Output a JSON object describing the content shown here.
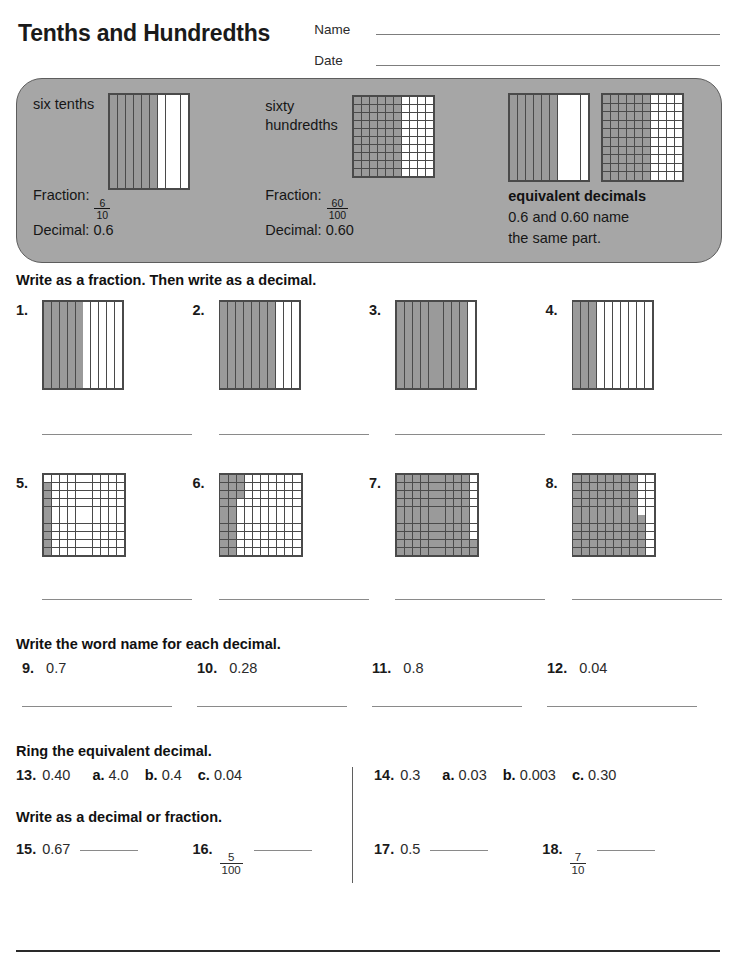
{
  "header": {
    "title": "Tenths and Hundredths",
    "name_label": "Name",
    "date_label": "Date"
  },
  "example": {
    "item1": {
      "word": "six tenths",
      "fraction_label": "Fraction:",
      "numerator": "6",
      "denominator": "10",
      "decimal_label": "Decimal:",
      "decimal_value": "0.6",
      "model": {
        "type": "tenths",
        "shaded": 6,
        "total": 10
      }
    },
    "item2": {
      "word_line1": "sixty",
      "word_line2": "hundredths",
      "fraction_label": "Fraction:",
      "numerator": "60",
      "denominator": "100",
      "decimal_label": "Decimal:",
      "decimal_value": "0.60",
      "model": {
        "type": "hundredths",
        "shaded_columns": 6,
        "total": 100
      }
    },
    "item3": {
      "title": "equivalent decimals",
      "text_line1": "0.6 and 0.60 name",
      "text_line2": "the same part.",
      "model_a": {
        "type": "tenths",
        "shaded": 6,
        "total": 10
      },
      "model_b": {
        "type": "hundredths",
        "shaded_columns": 6,
        "total": 100
      }
    }
  },
  "section1": {
    "instruction": "Write as a fraction. Then write as a decimal.",
    "problems": [
      {
        "num": "1.",
        "type": "tenths",
        "shaded": 5,
        "total": 10
      },
      {
        "num": "2.",
        "type": "tenths",
        "shaded": 7,
        "total": 10
      },
      {
        "num": "3.",
        "type": "tenths",
        "shaded": 9,
        "total": 10
      },
      {
        "num": "4.",
        "type": "tenths",
        "shaded": 3,
        "total": 10
      }
    ]
  },
  "section2": {
    "problems": [
      {
        "num": "5.",
        "type": "hundredths",
        "shaded": 9,
        "total": 100,
        "pattern": "col1-rows2to10"
      },
      {
        "num": "6.",
        "type": "hundredths",
        "shaded": 26,
        "total": 100,
        "pattern": "cols1to3-rows1to3-plus-cols1to2-rows4to10"
      },
      {
        "num": "7.",
        "type": "hundredths",
        "shaded": 92,
        "total": 100,
        "pattern": "cols1to9-plus-col10-rows9to10"
      },
      {
        "num": "8.",
        "type": "hundredths",
        "shaded": 85,
        "total": 100,
        "pattern": "cols1to8-rows1to5-plus-cols1to9-rows6to10"
      }
    ]
  },
  "section3": {
    "instruction": "Write the word name for each decimal.",
    "problems": [
      {
        "num": "9.",
        "value": "0.7"
      },
      {
        "num": "10.",
        "value": "0.28"
      },
      {
        "num": "11.",
        "value": "0.8"
      },
      {
        "num": "12.",
        "value": "0.04"
      }
    ]
  },
  "section4": {
    "instruction": "Ring the equivalent decimal.",
    "problems": [
      {
        "num": "13.",
        "value": "0.40",
        "choices": [
          {
            "letter": "a.",
            "value": "4.0"
          },
          {
            "letter": "b.",
            "value": "0.4"
          },
          {
            "letter": "c.",
            "value": "0.04"
          }
        ]
      },
      {
        "num": "14.",
        "value": "0.3",
        "choices": [
          {
            "letter": "a.",
            "value": "0.03"
          },
          {
            "letter": "b.",
            "value": "0.003"
          },
          {
            "letter": "c.",
            "value": "0.30"
          }
        ]
      }
    ]
  },
  "section5": {
    "instruction": "Write as a decimal or fraction.",
    "problems": [
      {
        "num": "15.",
        "kind": "decimal",
        "value": "0.67"
      },
      {
        "num": "16.",
        "kind": "fraction",
        "numerator": "5",
        "denominator": "100"
      },
      {
        "num": "17.",
        "kind": "decimal",
        "value": "0.5"
      },
      {
        "num": "18.",
        "kind": "fraction",
        "numerator": "7",
        "denominator": "10"
      }
    ]
  },
  "colors": {
    "shade": "#9a9a9a",
    "panel": "#a6a6a6",
    "grid_line": "#4a4a4a",
    "rule": "#8a8a8a",
    "text": "#1a1a1a"
  }
}
